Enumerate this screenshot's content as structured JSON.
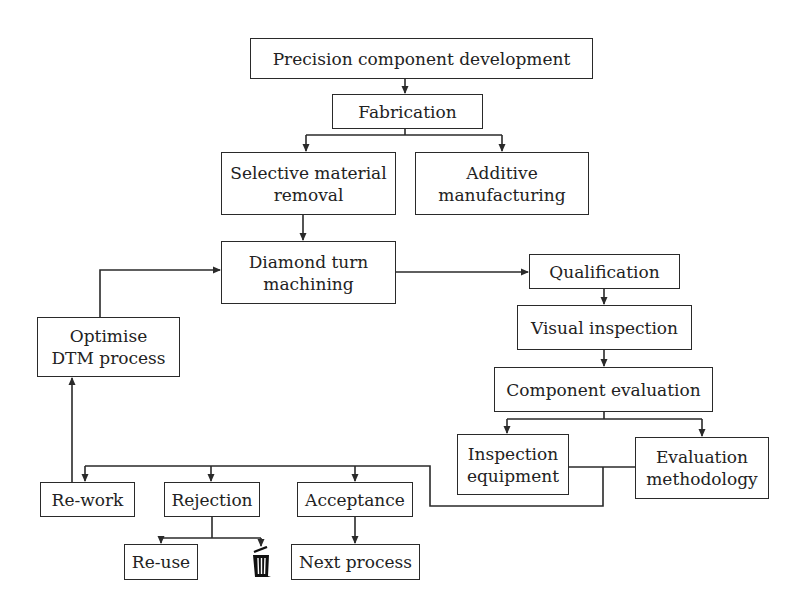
{
  "diagram": {
    "type": "flowchart",
    "colors": {
      "line": "#2a2a2a",
      "text": "#222222",
      "background": "#ffffff"
    },
    "nodes": {
      "precision": "Precision component development",
      "fabrication": "Fabrication",
      "selective": "Selective material\nremoval",
      "additive": "Additive\nmanufacturing",
      "diamond": "Diamond turn\nmachining",
      "optimise": "Optimise\nDTM process",
      "qualification": "Qualification",
      "visual": "Visual inspection",
      "component_eval": "Component evaluation",
      "inspection_equipment": "Inspection\nequipment",
      "evaluation_methodology": "Evaluation\nmethodology",
      "rework": "Re-work",
      "rejection": "Rejection",
      "acceptance": "Acceptance",
      "reuse": "Re-use",
      "discard_icon": "trash-icon",
      "next_process": "Next process"
    },
    "edges": [
      [
        "precision",
        "fabrication"
      ],
      [
        "fabrication",
        "selective"
      ],
      [
        "fabrication",
        "additive"
      ],
      [
        "selective",
        "diamond"
      ],
      [
        "diamond",
        "qualification"
      ],
      [
        "qualification",
        "visual"
      ],
      [
        "visual",
        "component_eval"
      ],
      [
        "component_eval",
        "inspection_equipment"
      ],
      [
        "component_eval",
        "evaluation_methodology"
      ],
      [
        "inspection_equipment+evaluation_methodology",
        "rework"
      ],
      [
        "inspection_equipment+evaluation_methodology",
        "rejection"
      ],
      [
        "inspection_equipment+evaluation_methodology",
        "acceptance"
      ],
      [
        "rework",
        "optimise"
      ],
      [
        "optimise",
        "diamond"
      ],
      [
        "rejection",
        "reuse"
      ],
      [
        "rejection",
        "discard"
      ],
      [
        "acceptance",
        "next_process"
      ]
    ]
  }
}
